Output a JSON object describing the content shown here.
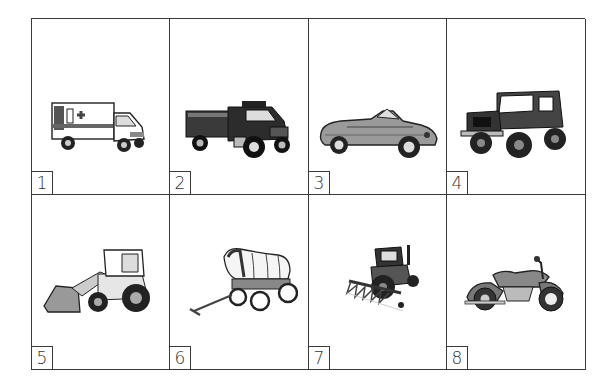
{
  "worksheet": {
    "cells": [
      {
        "number": "1",
        "icon": "ambulance-icon",
        "subject": "ambulance"
      },
      {
        "number": "2",
        "icon": "fire-truck-icon",
        "subject": "fire truck"
      },
      {
        "number": "3",
        "icon": "convertible-car-icon",
        "subject": "convertible car"
      },
      {
        "number": "4",
        "icon": "jeep-icon",
        "subject": "jeep"
      },
      {
        "number": "5",
        "icon": "front-loader-icon",
        "subject": "front loader"
      },
      {
        "number": "6",
        "icon": "covered-wagon-icon",
        "subject": "covered wagon"
      },
      {
        "number": "7",
        "icon": "tractor-icon",
        "subject": "tractor with harvester"
      },
      {
        "number": "8",
        "icon": "motorcycle-icon",
        "subject": "motorcycle"
      }
    ]
  },
  "colors": {
    "border": "#3a3a3a",
    "background": "#ffffff",
    "ink": "#222222",
    "mid_gray": "#7a7a7a",
    "light_gray": "#bdbdbd"
  }
}
